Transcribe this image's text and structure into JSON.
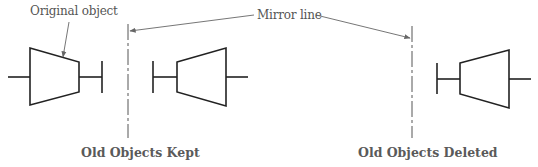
{
  "diagram": {
    "type": "mirror-command-illustration",
    "labels": {
      "original_object": "Original object",
      "mirror_line": "Mirror line"
    },
    "captions": {
      "left": "Old Objects Kept",
      "right": "Old Objects Deleted"
    },
    "colors": {
      "line": "#222222",
      "text": "#555555",
      "leader": "#666666"
    },
    "panels": [
      {
        "name": "old-objects-kept",
        "objects": [
          "original",
          "mirrored"
        ],
        "mirror_line_x": 128
      },
      {
        "name": "old-objects-deleted",
        "objects": [
          "mirrored"
        ],
        "mirror_line_x": 412
      }
    ]
  }
}
